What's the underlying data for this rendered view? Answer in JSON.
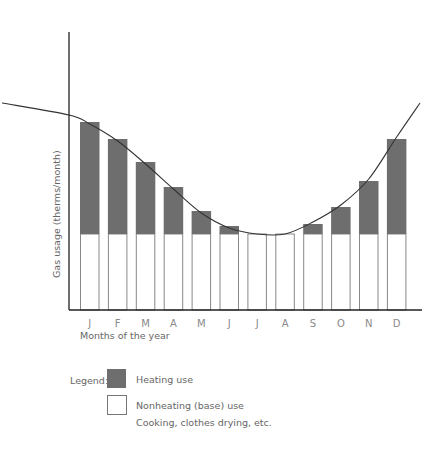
{
  "chart_data": {
    "type": "bar",
    "stacked": true,
    "title": "",
    "xlabel": "Months of the year",
    "ylabel": "Gas usage (therms/month)",
    "categories": [
      "J",
      "F",
      "M",
      "A",
      "M",
      "J",
      "J",
      "A",
      "S",
      "O",
      "N",
      "D"
    ],
    "series": [
      {
        "name": "Nonheating (base) use",
        "color": "#ffffff",
        "stroke": "#888888",
        "values": [
          76,
          76,
          76,
          76,
          76,
          76,
          76,
          76,
          76,
          76,
          76,
          76
        ]
      },
      {
        "name": "Heating use",
        "color": "#6e6e6e",
        "values": [
          112,
          95,
          72,
          47,
          23,
          8,
          0,
          0,
          10,
          27,
          53,
          95
        ]
      }
    ],
    "trend_curve": "smooth sinusoid-like curve following total usage, high in winter, low in summer",
    "y_ticks": [],
    "ylim": [
      0,
      278
    ],
    "grid": false,
    "legend_position": "bottom-left"
  },
  "legend": {
    "title": "Legend:",
    "items": [
      {
        "label": "Heating use",
        "swatch": "#6e6e6e"
      },
      {
        "label": "Nonheating (base) use",
        "swatch": "#ffffff",
        "sublabel": "Cooking, clothes drying, etc."
      }
    ]
  },
  "colors": {
    "heating": "#6e6e6e",
    "base_fill": "#ffffff",
    "base_stroke": "#888888",
    "axis": "#222222",
    "curve": "#333333",
    "text": "#777777"
  }
}
